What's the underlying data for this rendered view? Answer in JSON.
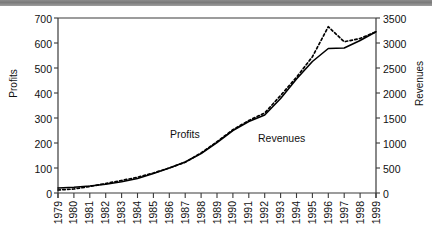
{
  "chart_data": {
    "type": "line",
    "title": "",
    "xlabel": "",
    "ylabel": "Profits",
    "ylabel_right": "Revenues",
    "grid": false,
    "legend_position": "inline-annotations",
    "x": [
      "1979",
      "1980",
      "1981",
      "1982",
      "1983",
      "1984",
      "1985",
      "1986",
      "1987",
      "1988",
      "1989",
      "1990",
      "1991",
      "1992",
      "1993",
      "1994",
      "1995",
      "1996",
      "1997",
      "1998",
      "1999"
    ],
    "xlim": [
      1979,
      1999
    ],
    "ylim": [
      0,
      700
    ],
    "yticks": [
      0,
      100,
      200,
      300,
      400,
      500,
      600,
      700
    ],
    "ylim_right": [
      0,
      3500
    ],
    "yticks_right": [
      0,
      500,
      1000,
      1500,
      2000,
      2500,
      3000,
      3500
    ],
    "axis_ratio_right_to_left": 5,
    "series": [
      {
        "name": "Revenues",
        "axis": "right",
        "style": "solid",
        "color": "#000000",
        "values": [
          100,
          115,
          140,
          175,
          225,
          290,
          390,
          500,
          620,
          790,
          1010,
          1250,
          1430,
          1560,
          1890,
          2280,
          2630,
          2890,
          2900,
          3050,
          3225
        ]
      },
      {
        "name": "Profits",
        "axis": "left",
        "style": "dotted",
        "color": "#000000",
        "values": [
          12,
          16,
          26,
          38,
          50,
          63,
          80,
          100,
          123,
          160,
          205,
          253,
          290,
          320,
          390,
          463,
          545,
          665,
          605,
          618,
          645
        ]
      }
    ],
    "annotations": [
      {
        "text": "Profits",
        "x_px": 170,
        "y_px": 133
      },
      {
        "text": "Revenues",
        "x_px": 258,
        "y_px": 137
      }
    ]
  },
  "axes": {
    "left_title": "Profits",
    "right_title": "Revenues",
    "left_ticks": [
      "0",
      "100",
      "200",
      "300",
      "400",
      "500",
      "600",
      "700"
    ],
    "right_ticks": [
      "0",
      "500",
      "1000",
      "1500",
      "2000",
      "2500",
      "3000",
      "3500"
    ],
    "x_ticks": [
      "1979",
      "1980",
      "1981",
      "1982",
      "1983",
      "1984",
      "1985",
      "1986",
      "1987",
      "1988",
      "1989",
      "1990",
      "1991",
      "1992",
      "1993",
      "1994",
      "1995",
      "1996",
      "1997",
      "1998",
      "1999"
    ]
  },
  "colors": {
    "line": "#000000",
    "axis": "#3a3a3a",
    "topbar": "#8c8c8c",
    "background": "#ffffff"
  }
}
